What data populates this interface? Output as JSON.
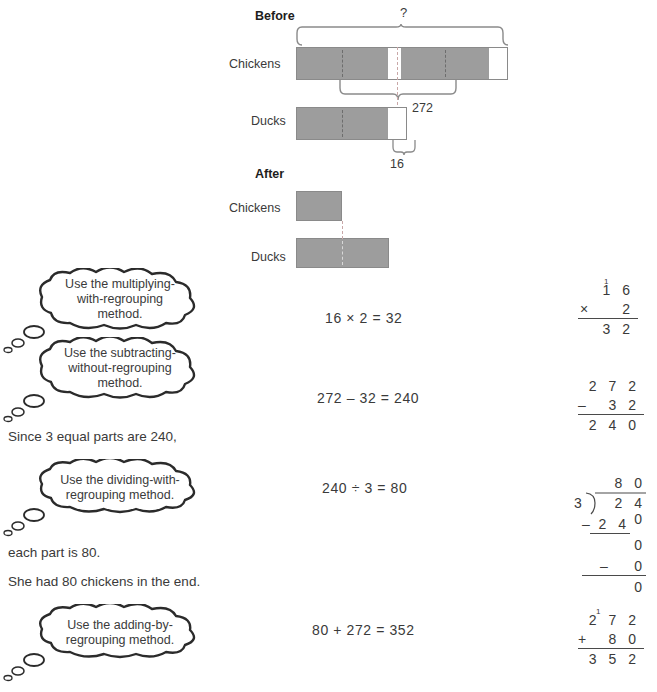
{
  "model": {
    "before_heading": "Before",
    "after_heading": "After",
    "before_chickens_label": "Chickens",
    "before_ducks_label": "Ducks",
    "after_chickens_label": "Chickens",
    "after_ducks_label": "Ducks",
    "unknown_marker": "?",
    "total_272": "272",
    "remainder_16": "16"
  },
  "bubbles": [
    {
      "name": "multiplying",
      "line1": "Use the multiplying-",
      "line2": "with-regrouping",
      "line3": "method."
    },
    {
      "name": "subtracting",
      "line1": "Use the subtracting-",
      "line2": "without-regrouping",
      "line3": "method."
    },
    {
      "name": "dividing",
      "line1": "Use the dividing-with-",
      "line2": "regrouping method.",
      "line3": ""
    },
    {
      "name": "adding",
      "line1": "Use the adding-by-",
      "line2": "regrouping method.",
      "line3": ""
    }
  ],
  "equations": {
    "multiply": "16 × 2 = 32",
    "subtract": "272 – 32 = 240",
    "divide": "240 ÷ 3 = 80",
    "add": "80 + 272 = 352"
  },
  "narratives": {
    "since": "Since 3 equal parts are 240,",
    "each_part": "each part is 80.",
    "conclusion": "She had 80 chickens in the end."
  },
  "calcs": {
    "multiplication": {
      "carry": "1",
      "top": "1 6",
      "operator": "×",
      "bottom": "2",
      "result": "3 2"
    },
    "subtraction": {
      "top": "2 7 2",
      "operator": "–",
      "bottom": "3 2",
      "result": "2 4 0"
    },
    "division": {
      "quotient": "8 0",
      "divisor": "3",
      "dividend": "2 4 0",
      "step1_op": "–",
      "step1": "2 4",
      "step1_result": "0",
      "step2_op": "–",
      "step2": "0",
      "step2_result": "0"
    },
    "addition": {
      "carry": "1",
      "top": "2 7 2",
      "operator": "+",
      "bottom": "8 0",
      "result": "3 5 2"
    }
  },
  "colors": {
    "bar_fill": "#9d9d9d",
    "bar_stroke": "#8a8a8a",
    "ink": "#3a3a3a"
  }
}
